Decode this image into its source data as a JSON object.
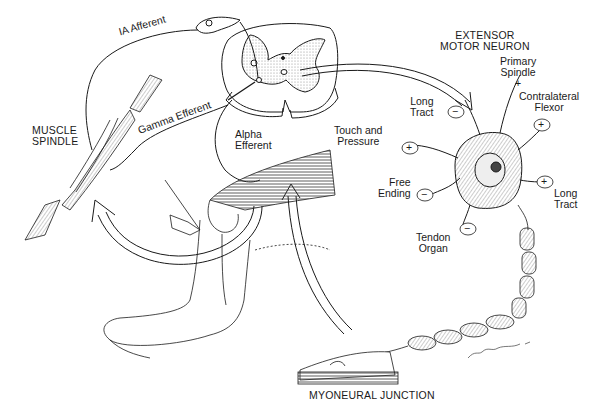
{
  "diagram": {
    "labels": {
      "ia_afferent": "IA Afferent",
      "gamma_efferent": "Gamma Efferent",
      "muscle_spindle_line1": "MUSCLE",
      "muscle_spindle_line2": "SPINDLE",
      "alpha_efferent_line1": "Alpha",
      "alpha_efferent_line2": "Efferent",
      "extensor_line1": "EXTENSOR",
      "extensor_line2": "MOTOR NEURON",
      "primary_spindle_line1": "Primary",
      "primary_spindle_line2": "Spindle",
      "contralateral_line1": "Contralateral",
      "contralateral_line2": "Flexor",
      "long_tract_left_line1": "Long",
      "long_tract_left_line2": "Tract",
      "touch_line1": "Touch and",
      "touch_line2": "Pressure",
      "free_ending_line1": "Free",
      "free_ending_line2": "Ending",
      "long_tract_right_line1": "Long",
      "long_tract_right_line2": "Tract",
      "tendon_organ_line1": "Tendon",
      "tendon_organ_line2": "Organ",
      "myoneural_junction": "MYONEURAL JUNCTION",
      "signature": "Ergo Gogler '86"
    },
    "synapse_signs": {
      "primary_spindle": "+",
      "contralateral_flexor": "+",
      "long_tract_left": "−",
      "touch_pressure": "+",
      "free_ending": "−",
      "long_tract_right": "+",
      "tendon_organ": "−"
    },
    "colors": {
      "ink": "#1a1a1a",
      "gray_matter": "#cfcfcf",
      "background": "#ffffff"
    }
  }
}
